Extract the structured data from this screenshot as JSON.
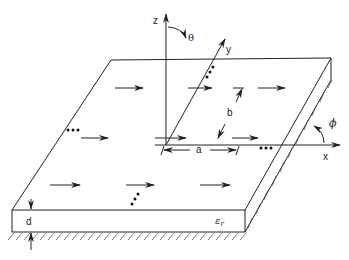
{
  "diagram": {
    "type": "phased array of dipoles on grounded dielectric slab",
    "labels": {
      "z_axis": "z",
      "y_axis": "y",
      "x_axis": "x",
      "theta": "θ",
      "phi": "ϕ",
      "spacing_x": "a",
      "spacing_y": "b",
      "thickness": "d",
      "permittivity": "ε",
      "permittivity_sub": "r"
    },
    "ellipsis": "•••",
    "colors": {
      "line": "#222222",
      "background": "#ffffff"
    }
  }
}
